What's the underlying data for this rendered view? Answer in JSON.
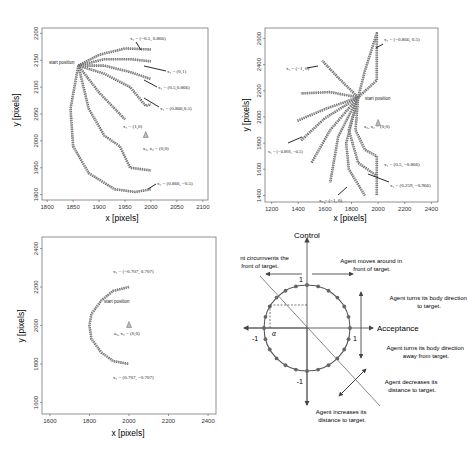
{
  "chart_data": [
    {
      "type": "scatter",
      "panel": "top-left",
      "xlabel": "x [pixels]",
      "ylabel": "y [pixels]",
      "xlim": [
        1790,
        2110
      ],
      "ylim": [
        1890,
        2210
      ],
      "xticks": [
        "1800",
        "1850",
        "1900",
        "1950",
        "2000",
        "2050",
        "2100"
      ],
      "yticks": [
        "1900",
        "1950",
        "2000",
        "2050",
        "2100",
        "2150",
        "2200"
      ],
      "grid": false,
      "annotations": {
        "start": "start position",
        "target": "a₂, x₂ = (0,0)",
        "labels": [
          "x₁ = (−0.5, 0.866)",
          "x₁ = (0,1)",
          "x₁ = (0.5,0.866)",
          "x₁ = (0.866,0.5)",
          "x₁ = (1,0)",
          "x₁ = (0.866, −0.5)"
        ]
      },
      "start_position": [
        1860,
        2140
      ],
      "target_position": [
        1990,
        2010
      ],
      "series": [
        {
          "name": "x1=(-0.5,0.866)",
          "points": [
            [
              1860,
              2140
            ],
            [
              1900,
              2160
            ],
            [
              1950,
              2172
            ],
            [
              2000,
              2170
            ]
          ]
        },
        {
          "name": "x1=(0,1)",
          "points": [
            [
              1860,
              2140
            ],
            [
              1910,
              2152
            ],
            [
              1960,
              2152
            ],
            [
              2000,
              2148
            ]
          ]
        },
        {
          "name": "x1=(0.5,0.866)",
          "points": [
            [
              1860,
              2140
            ],
            [
              1910,
              2140
            ],
            [
              1960,
              2128
            ],
            [
              2000,
              2115
            ]
          ]
        },
        {
          "name": "x1=(0.866,0.5)",
          "points": [
            [
              1860,
              2140
            ],
            [
              1910,
              2125
            ],
            [
              1960,
              2100
            ],
            [
              1990,
              2065
            ],
            [
              2000,
              2068
            ]
          ]
        },
        {
          "name": "x1=(1,0)",
          "points": [
            [
              1860,
              2140
            ],
            [
              1900,
              2090
            ],
            [
              1950,
              2040
            ]
          ]
        },
        {
          "name": "x1=(0.866,-0.5)",
          "points": [
            [
              1860,
              2140
            ],
            [
              1880,
              2060
            ],
            [
              1910,
              2010
            ],
            [
              1940,
              1990
            ],
            [
              1960,
              1950
            ],
            [
              2000,
              1945
            ]
          ]
        },
        {
          "name": "outer-arc",
          "points": [
            [
              1860,
              2140
            ],
            [
              1845,
              2060
            ],
            [
              1850,
              1990
            ],
            [
              1880,
              1940
            ],
            [
              1930,
              1910
            ],
            [
              1970,
              1905
            ],
            [
              2000,
              1910
            ]
          ]
        }
      ]
    },
    {
      "type": "scatter",
      "panel": "top-right",
      "xlabel": "x [pixels]",
      "ylabel": "y [pixels]",
      "xlim": [
        1150,
        2450
      ],
      "ylim": [
        1350,
        2680
      ],
      "xticks": [
        "1200",
        "1400",
        "1600",
        "1800",
        "2000",
        "2200",
        "2400"
      ],
      "yticks": [
        "1400",
        "1600",
        "1800",
        "2000",
        "2200",
        "2400",
        "2600"
      ],
      "grid": false,
      "annotations": {
        "start": "start position",
        "target": "a₂, x₂ = (0,0)",
        "labels": [
          "x₁ = (−0.866, 0.5)",
          "x₁ = (−1, 0)",
          "x₁ = (−0.866, −0.5)",
          "x₁ = (0.5, −0.866)",
          "x₁ = (0.259, −0.966)",
          "x₁ = (−1, 0)"
        ]
      },
      "start_position": [
        1850,
        2150
      ],
      "target_position": [
        2000,
        1950
      ],
      "series": [
        {
          "name": "x1=(-0.866,0.5)",
          "points": [
            [
              1850,
              2150
            ],
            [
              1900,
              2350
            ],
            [
              1990,
              2640
            ],
            [
              1990,
              2280
            ],
            [
              1850,
              2150
            ]
          ]
        },
        {
          "name": "x1=(-1,0) upper",
          "points": [
            [
              1850,
              2150
            ],
            [
              1700,
              2300
            ],
            [
              1580,
              2430
            ]
          ]
        },
        {
          "name": "x1=(-1,0) left",
          "points": [
            [
              1850,
              2150
            ],
            [
              1640,
              2190
            ],
            [
              1420,
              2180
            ]
          ]
        },
        {
          "name": "fan-1",
          "points": [
            [
              1850,
              2150
            ],
            [
              1600,
              2060
            ],
            [
              1390,
              1970
            ]
          ]
        },
        {
          "name": "fan-2",
          "points": [
            [
              1850,
              2150
            ],
            [
              1600,
              1990
            ],
            [
              1420,
              1820
            ]
          ]
        },
        {
          "name": "fan-3",
          "points": [
            [
              1850,
              2150
            ],
            [
              1640,
              1900
            ],
            [
              1500,
              1650
            ]
          ]
        },
        {
          "name": "fan-4",
          "points": [
            [
              1850,
              2150
            ],
            [
              1700,
              1850
            ],
            [
              1640,
              1500
            ]
          ]
        },
        {
          "name": "x1=(-1,0) lower",
          "points": [
            [
              1850,
              2150
            ],
            [
              1760,
              1800
            ],
            [
              1780,
              1600
            ],
            [
              1900,
              1400
            ]
          ]
        },
        {
          "name": "x1=(0.259,-0.966)",
          "points": [
            [
              1850,
              2150
            ],
            [
              1780,
              1900
            ],
            [
              1850,
              1650
            ],
            [
              1990,
              1550
            ]
          ]
        },
        {
          "name": "x1=(0.5,-0.866)",
          "points": [
            [
              1850,
              2150
            ],
            [
              1830,
              1900
            ],
            [
              1900,
              1750
            ],
            [
              1990,
              1700
            ],
            [
              1990,
              1400
            ]
          ]
        }
      ]
    },
    {
      "type": "scatter",
      "panel": "bottom-left",
      "xlabel": "x [pixels]",
      "ylabel": "y [pixels]",
      "xlim": [
        1560,
        2440
      ],
      "ylim": [
        1540,
        2460
      ],
      "xticks": [
        "1600",
        "1800",
        "2000",
        "2200",
        "2400"
      ],
      "yticks": [
        "1600",
        "1800",
        "2000",
        "2200",
        "2400"
      ],
      "grid": false,
      "annotations": {
        "start": "start position",
        "target": "a₂, x₂ = (0,0)",
        "labels": [
          "x₁ = (−0.707, 0.707)",
          "x₁ = (0.707, −0.707)"
        ]
      },
      "start_position": [
        1990,
        2200
      ],
      "target_position": [
        2000,
        2000
      ],
      "series": [
        {
          "name": "semicircle",
          "points": [
            [
              2000,
              2200
            ],
            [
              1920,
              2180
            ],
            [
              1860,
              2130
            ],
            [
              1810,
              2060
            ],
            [
              1800,
              2000
            ],
            [
              1810,
              1930
            ],
            [
              1860,
              1860
            ],
            [
              1920,
              1815
            ],
            [
              2000,
              1800
            ]
          ]
        }
      ]
    },
    {
      "type": "diagram",
      "panel": "bottom-right",
      "xlabel": "Acceptance",
      "ylabel": "Control",
      "xlim": [
        -1.4,
        1.4
      ],
      "ylim": [
        -1.4,
        1.4
      ],
      "tick_labels": {
        "x_pos": "1",
        "x_neg": "-1",
        "y_pos": "1",
        "y_neg": "-1",
        "alpha": "α"
      },
      "circle_radius": 1,
      "circle_points": 24,
      "annotations": [
        "Agent circumvents the front of target.",
        "Agent moves around in front of target.",
        "Agent turns its body direction to target.",
        "Agent turns its body direction away from target.",
        "Agent decreases its distance to target.",
        "Agent increases its distance to target."
      ]
    }
  ],
  "diagram": {
    "axis_x": "Acceptance",
    "axis_y": "Control",
    "one": "1",
    "minus_one": "-1",
    "alpha": "α",
    "ann_circumvent_1": "Agent circumvents the",
    "ann_circumvent_2": "front of target.",
    "ann_moves_1": "Agent moves around in",
    "ann_moves_2": "front of target.",
    "ann_turns_to_1": "Agent turns its body direction",
    "ann_turns_to_2": "to target.",
    "ann_turns_away_1": "Agent turns its body direction",
    "ann_turns_away_2": "away from target.",
    "ann_decreases_1": "Agent decreases its",
    "ann_decreases_2": "distance to target.",
    "ann_increases_1": "Agent increases its",
    "ann_increases_2": "distance to target."
  },
  "colors": {
    "trajectory": "#555555",
    "frame": "#333333",
    "text": "#222222"
  }
}
